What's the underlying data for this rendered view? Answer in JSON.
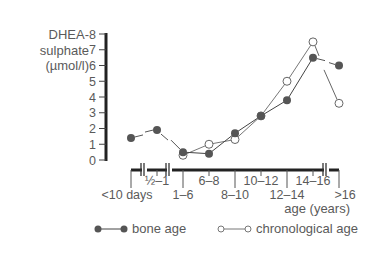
{
  "chart_data": {
    "type": "line",
    "title": "",
    "ylabel_lines": [
      "DHEA-",
      "sulphate",
      "(µmol/l)"
    ],
    "xlabel": "age (years)",
    "ylim": [
      0,
      8
    ],
    "yticks": [
      0,
      1,
      2,
      3,
      4,
      5,
      6,
      7,
      8
    ],
    "grid": false,
    "legend_position": "bottom",
    "categories": [
      "<10 days",
      "½–1",
      "1–6",
      "6–8",
      "8–10",
      "10–12",
      "12–14",
      "14–16",
      ">16"
    ],
    "x_tick_labels_upper": [
      "½–1",
      "6–8",
      "10–12",
      "14–16"
    ],
    "x_tick_labels_lower": [
      "<10 days",
      "1–6",
      "8–10",
      "12–14",
      ">16"
    ],
    "series": [
      {
        "name": "bone age",
        "marker": "filled-circle",
        "color": "#555555",
        "values": [
          1.4,
          1.9,
          0.5,
          0.4,
          1.7,
          2.8,
          3.8,
          6.5,
          6.0
        ]
      },
      {
        "name": "chronological age",
        "marker": "open-circle",
        "color": "#777777",
        "values": [
          null,
          null,
          0.3,
          1.0,
          1.3,
          2.8,
          5.0,
          7.5,
          3.6
        ]
      }
    ]
  },
  "legend": {
    "bone_age": "bone age",
    "chronological_age": "chronological age"
  }
}
